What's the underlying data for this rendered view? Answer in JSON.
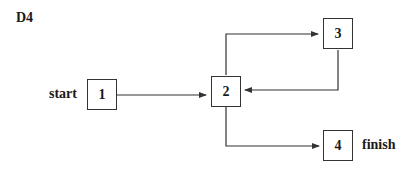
{
  "diagram": {
    "title": "D4",
    "nodes": [
      {
        "id": "1",
        "label": "1"
      },
      {
        "id": "2",
        "label": "2"
      },
      {
        "id": "3",
        "label": "3"
      },
      {
        "id": "4",
        "label": "4"
      }
    ],
    "start_label": "start",
    "finish_label": "finish",
    "edges": [
      {
        "from": "1",
        "to": "2"
      },
      {
        "from": "2",
        "to": "3"
      },
      {
        "from": "3",
        "to": "2"
      },
      {
        "from": "2",
        "to": "4"
      }
    ]
  }
}
